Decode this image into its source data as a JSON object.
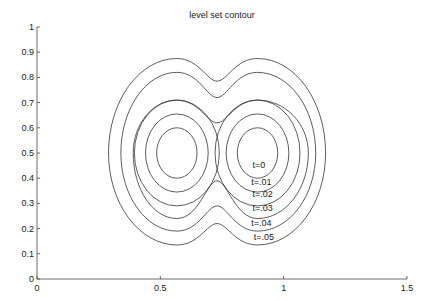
{
  "chart_data": {
    "type": "line",
    "title": "level set contour",
    "xlabel": "",
    "ylabel": "",
    "xlim": [
      0,
      1.5
    ],
    "ylim": [
      0,
      1
    ],
    "grid": false,
    "legend": "none",
    "x_ticks": [
      "0",
      "0.5",
      "1",
      "1.5"
    ],
    "x_tick_values": [
      0,
      0.5,
      1,
      1.5
    ],
    "y_ticks": [
      "0",
      "0.1",
      "0.2",
      "0.3",
      "0.4",
      "0.5",
      "0.6",
      "0.7",
      "0.8",
      "0.9",
      "1"
    ],
    "y_tick_values": [
      0,
      0.1,
      0.2,
      0.3,
      0.4,
      0.5,
      0.6,
      0.7,
      0.8,
      0.9,
      1
    ],
    "series": [
      {
        "name": "t=0",
        "label": "t=0",
        "shape": "two-circles",
        "centers": [
          [
            0.567,
            0.5
          ],
          [
            0.894,
            0.5
          ]
        ],
        "radius": 0.1,
        "label_pos": [
          0.9,
          0.44
        ]
      },
      {
        "name": "t=.01",
        "label": "t=.01",
        "shape": "two-circles",
        "centers": [
          [
            0.567,
            0.5
          ],
          [
            0.894,
            0.5
          ]
        ],
        "radius": 0.155,
        "label_pos": [
          0.91,
          0.375
        ]
      },
      {
        "name": "t=.02",
        "label": "t=.02",
        "shape": "two-circles",
        "centers": [
          [
            0.567,
            0.5
          ],
          [
            0.894,
            0.5
          ]
        ],
        "radius": 0.21,
        "label_pos": [
          0.915,
          0.325
        ]
      },
      {
        "name": "t=.03",
        "label": "t=.03",
        "shape": "merged",
        "x_extent": [
          0.39,
          1.1
        ],
        "y_extent": [
          0.24,
          0.71
        ],
        "neck_y": [
          0.39,
          0.62
        ],
        "label_pos": [
          0.915,
          0.27
        ]
      },
      {
        "name": "t=.04",
        "label": "t=.04",
        "shape": "merged",
        "x_extent": [
          0.34,
          1.13
        ],
        "y_extent": [
          0.19,
          0.82
        ],
        "neck_y": [
          0.29,
          0.72
        ],
        "label_pos": [
          0.91,
          0.21
        ]
      },
      {
        "name": "t=.05",
        "label": "t=.05",
        "shape": "merged",
        "x_extent": [
          0.29,
          1.17
        ],
        "y_extent": [
          0.135,
          0.875
        ],
        "neck_y": [
          0.22,
          0.785
        ],
        "label_pos": [
          0.92,
          0.155
        ]
      }
    ]
  },
  "figure": {
    "title": "level set contour",
    "contour_color": "#333333",
    "axis_color": "#444444",
    "background": "#ffffff"
  }
}
